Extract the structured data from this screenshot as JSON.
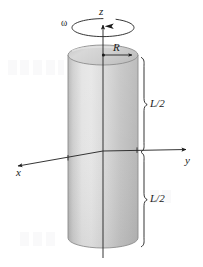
{
  "figure": {
    "kind": "physics-diagram",
    "background_color": "#ffffff",
    "ink_color": "#1a1a1a"
  },
  "axes": {
    "z": {
      "label": "z",
      "direction": "up",
      "arrowhead": "up"
    },
    "y": {
      "label": "y",
      "direction": "right",
      "arrowhead": "right"
    },
    "x": {
      "label": "x",
      "direction": "down-left (toward viewer)",
      "arrowhead": "down-left"
    }
  },
  "annotations": {
    "angular_velocity": {
      "label": "ω",
      "icon": "rotation-ellipse-arrow",
      "meaning": "angular velocity about z"
    },
    "radius": {
      "label": "R",
      "icon": "radius-arrow",
      "meaning": "cylinder radius measured from the z axis to the rim"
    },
    "half_length_upper": {
      "label": "L/2",
      "icon": "curly-brace-right",
      "meaning": "upper half length of the cylinder"
    },
    "half_length_lower": {
      "label": "L/2",
      "icon": "curly-brace-right",
      "meaning": "lower half length of the cylinder"
    }
  },
  "cylinder": {
    "top_face_fill": "#d2d2d2",
    "body_fill_light": "#e2e2e2",
    "body_fill_mid": "#c9c9c9",
    "body_fill_dark": "#b2b2b2",
    "outline_color": "#8a8a8a"
  }
}
